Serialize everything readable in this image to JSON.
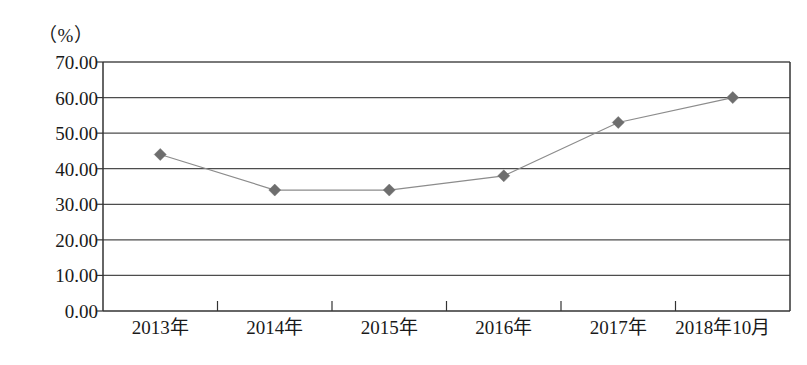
{
  "chart_data": {
    "type": "line",
    "title": "",
    "subtitle": "",
    "unit_label": "（%）",
    "xlabel": "",
    "ylabel": "",
    "categories": [
      "2013年",
      "2014年",
      "2015年",
      "2016年",
      "2017年",
      "2018年10月"
    ],
    "values": [
      44.0,
      34.0,
      34.0,
      38.0,
      53.0,
      60.0
    ],
    "series": [
      {
        "name": "",
        "values": [
          44.0,
          34.0,
          34.0,
          38.0,
          53.0,
          60.0
        ]
      }
    ],
    "ylim": [
      0,
      70
    ],
    "ytick_values": [
      0,
      10,
      20,
      30,
      40,
      50,
      60,
      70
    ],
    "ytick_labels": [
      "0.00",
      "10.00",
      "20.00",
      "30.00",
      "40.00",
      "50.00",
      "60.00",
      "70.00"
    ],
    "grid": true,
    "grid_axis": "y",
    "legend": "none",
    "marker": "diamond",
    "line_color": "#8c8c8c",
    "marker_color": "#6e6e6e",
    "axis_color": "#333333",
    "grid_color": "#4d4d4d",
    "background": "#ffffff"
  }
}
